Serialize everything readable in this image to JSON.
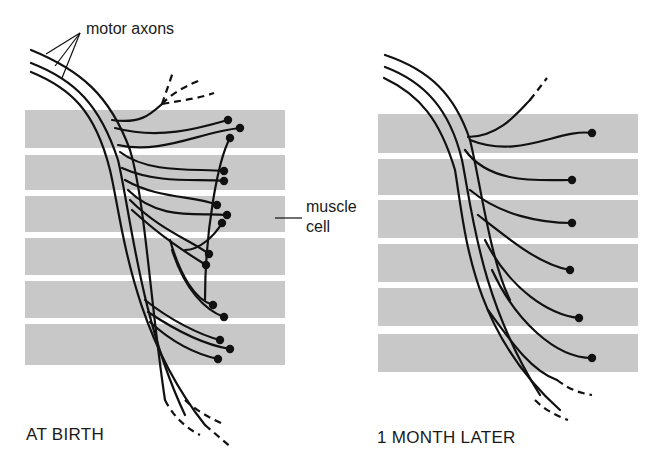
{
  "colors": {
    "band": "#c8c8c8",
    "ink": "#111111",
    "background": "#ffffff"
  },
  "labels": {
    "motor_axons": "motor axons",
    "muscle": "muscle",
    "cell": "cell",
    "left_caption": "AT BIRTH",
    "right_caption": "1 MONTH LATER"
  },
  "panels": [
    {
      "id": "at-birth",
      "x": 25,
      "width": 260,
      "bands": [
        [
          110,
          148
        ],
        [
          155,
          190
        ],
        [
          196,
          232
        ],
        [
          238,
          275
        ],
        [
          281,
          318
        ],
        [
          324,
          365
        ]
      ],
      "axons": [
        "M31,50 C80,70 110,95 130,150 C145,200 150,300 165,400",
        "M31,63 C75,80 100,105 118,160 C130,210 140,320 185,415",
        "M31,72 C70,88 95,110 110,170 C122,220 130,330 205,425"
      ],
      "branches": [
        "M112,120 C140,124 150,115 162,104",
        "M115,128 C160,140 200,128 228,120",
        "M118,145 C160,155 200,132 240,128",
        "M205,300 C205,230 218,160 230,138",
        "M120,152 C150,175 200,168 224,171",
        "M122,168 C160,185 200,178 224,181",
        "M125,180 C160,200 195,195 217,205",
        "M128,190 C160,222 200,212 227,215",
        "M185,250 C200,250 215,235 222,223",
        "M130,200 C160,230 190,240 209,254",
        "M132,210 C165,240 190,255 206,265",
        "M170,240 C180,275 195,300 213,305",
        "M172,250 C185,290 205,310 224,317",
        "M145,300 C170,320 200,335 220,340",
        "M148,312 C175,330 205,345 230,349",
        "M150,322 C175,345 200,355 218,359"
      ],
      "dashes": [
        "M162,104 L173,72",
        "M162,104 C175,90 190,85 200,80",
        "M162,104 C185,100 200,98 214,93",
        "M185,400 C195,410 210,418 225,425",
        "M205,425 L232,448",
        "M165,400 C175,420 190,430 200,435"
      ],
      "dots": [
        [
          228,
          120
        ],
        [
          240,
          128
        ],
        [
          230,
          138
        ],
        [
          224,
          171
        ],
        [
          224,
          181
        ],
        [
          217,
          205
        ],
        [
          227,
          215
        ],
        [
          222,
          223
        ],
        [
          209,
          254
        ],
        [
          206,
          265
        ],
        [
          213,
          305
        ],
        [
          224,
          317
        ],
        [
          220,
          340
        ],
        [
          230,
          349
        ],
        [
          218,
          359
        ]
      ]
    },
    {
      "id": "one-month-later",
      "x": 378,
      "width": 260,
      "bands": [
        [
          114,
          153
        ],
        [
          159,
          195
        ],
        [
          200,
          238
        ],
        [
          244,
          282
        ],
        [
          288,
          326
        ],
        [
          334,
          372
        ]
      ],
      "axons": [
        "M385,55 C430,70 455,95 470,140 C480,180 490,260 510,300",
        "M385,67 C425,82 450,110 462,160 C472,210 480,300 540,395",
        "M384,78 C420,95 440,120 455,170 C465,230 470,330 560,410"
      ],
      "branches": [
        "M468,137 C500,137 520,110 530,100",
        "M470,140 C520,160 560,128 592,133",
        "M465,150 C490,185 540,180 572,180",
        "M470,190 C500,215 540,223 572,223",
        "M478,215 C510,240 540,265 570,270",
        "M485,240 C510,290 550,315 579,318",
        "M492,270 C515,320 555,358 592,358",
        "M488,310 C510,340 530,370 557,380"
      ],
      "dashes": [
        "M530,100 L547,78",
        "M557,380 C570,390 580,393 592,395",
        "M535,400 C545,410 555,415 568,420"
      ],
      "dots": [
        [
          592,
          133
        ],
        [
          572,
          180
        ],
        [
          572,
          223
        ],
        [
          570,
          270
        ],
        [
          579,
          318
        ],
        [
          592,
          358
        ]
      ]
    }
  ],
  "pointers": {
    "motor_axons": [
      [
        80,
        33,
        46,
        54
      ],
      [
        80,
        33,
        55,
        66
      ],
      [
        80,
        33,
        62,
        78
      ]
    ],
    "muscle_cell": [
      [
        275,
        218,
        302,
        218
      ]
    ]
  }
}
